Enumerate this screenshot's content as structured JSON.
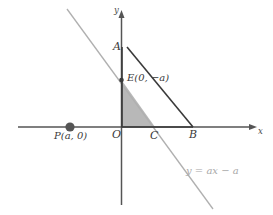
{
  "figure": {
    "kind": "coordinate-geometry-diagram",
    "background_color": "#ffffff"
  },
  "axes": {
    "x_axis": {
      "label": "x",
      "color": "#555555",
      "y_pixel": 127,
      "x_start": 18,
      "x_end": 255,
      "arrow": "right"
    },
    "y_axis": {
      "label": "y",
      "color": "#555555",
      "x_pixel": 121,
      "y_start": 12,
      "y_end": 205,
      "arrow": "up"
    }
  },
  "points": {
    "A": {
      "label": "A",
      "color": "#3a3a3a"
    },
    "B": {
      "label": "B",
      "color": "#3a3a3a"
    },
    "C": {
      "label": "C",
      "color": "#3a3a3a"
    },
    "O": {
      "label": "O",
      "color": "#3a3a3a"
    },
    "E": {
      "label": "E(0, −a)",
      "color": "#3a3a3a"
    },
    "P": {
      "label": "P(a, 0)",
      "color": "#3a3a3a",
      "marker": "filled-dot",
      "marker_color": "#555555"
    }
  },
  "lines": {
    "segment_AB": {
      "color": "#3a3a3a",
      "width": 1.6
    },
    "line_equation": {
      "text": "y = ax − a",
      "color": "#b0b0b0",
      "width": 1.3
    }
  },
  "shaded_region": {
    "name": "triangle-EOC",
    "fill": "#b8b8b8",
    "vertices": "E, O, C"
  },
  "colors": {
    "axis": "#555555",
    "segment": "#3a3a3a",
    "gray_line": "#b0b0b0",
    "shade": "#b8b8b8",
    "text": "#3a3a3a",
    "faint_text": "#a8a8a8"
  }
}
